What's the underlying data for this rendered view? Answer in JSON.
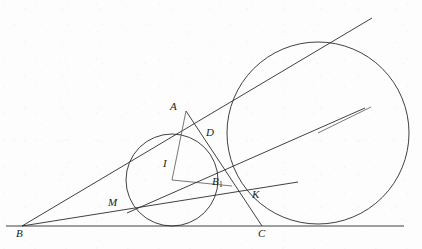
{
  "figure": {
    "background_color": "#fdfdfd",
    "stroke_color": "#2b2b2b",
    "label_color": "#1a1a1a",
    "width": 422,
    "height": 249
  },
  "points": [
    {
      "id": "A",
      "label": "A",
      "sub": "",
      "x": 196,
      "y": 123,
      "label_x": 170,
      "label_y": 101
    },
    {
      "id": "B",
      "label": "B",
      "sub": "",
      "x": 22,
      "y": 226,
      "label_x": 16,
      "label_y": 228
    },
    {
      "id": "C",
      "label": "C",
      "sub": "",
      "x": 262,
      "y": 226,
      "label_x": 258,
      "label_y": 228
    },
    {
      "id": "D",
      "label": "D",
      "sub": "",
      "x": 205,
      "y": 146,
      "label_x": 206,
      "label_y": 127
    },
    {
      "id": "I",
      "label": "I",
      "sub": "",
      "x": 172,
      "y": 180,
      "label_x": 163,
      "label_y": 158
    },
    {
      "id": "M",
      "label": "M",
      "sub": "",
      "x": 133,
      "y": 211,
      "label_x": 108,
      "label_y": 197
    },
    {
      "id": "K",
      "label": "K",
      "sub": "",
      "x": 243,
      "y": 198,
      "label_x": 252,
      "label_y": 189
    },
    {
      "id": "B1",
      "label": "B",
      "sub": "1",
      "x": 214,
      "y": 193,
      "label_x": 212,
      "label_y": 176
    }
  ],
  "circles": [
    {
      "id": "incircle",
      "name": "incircle",
      "cx": 172,
      "cy": 180,
      "r": 46
    },
    {
      "id": "excircle",
      "name": "excircle",
      "cx": 318,
      "cy": 133,
      "r": 91
    }
  ],
  "segments": [
    {
      "id": "baseline",
      "name": "base-line-BC-extended",
      "x1": 6,
      "y1": 226,
      "x2": 404,
      "y2": 226
    },
    {
      "id": "ray-B-upper",
      "name": "ray-B-through-A-tangent",
      "x1": 22,
      "y1": 226,
      "x2": 372,
      "y2": 18
    },
    {
      "id": "ray-B-lower",
      "name": "ray-B-through-M-K",
      "x1": 22,
      "y1": 226,
      "x2": 298,
      "y2": 182
    },
    {
      "id": "seg-A-D-K-C",
      "name": "cevian-A-to-C",
      "x1": 186,
      "y1": 111,
      "x2": 262,
      "y2": 226
    },
    {
      "id": "seg-A-I",
      "name": "segment-A-I",
      "x1": 186,
      "y1": 111,
      "x2": 172,
      "y2": 180
    },
    {
      "id": "seg-I-B1",
      "name": "segment-I-B1",
      "x1": 172,
      "y1": 180,
      "x2": 232,
      "y2": 186
    },
    {
      "id": "seg-M-D-excircle",
      "name": "line-M-D-to-excircle",
      "x1": 127,
      "y1": 213,
      "x2": 365,
      "y2": 108
    },
    {
      "id": "seg-excircle-radius",
      "name": "excircle-radius",
      "x1": 318,
      "y1": 133,
      "x2": 371,
      "y2": 107
    }
  ]
}
